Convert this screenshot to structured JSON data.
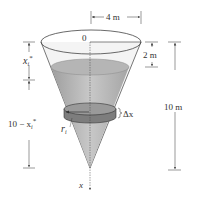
{
  "figure": {
    "labels": {
      "origin": "0",
      "top_width": "4 m",
      "water_offset": "2 m",
      "height": "10 m",
      "depth_upper": "x",
      "depth_upper_sub": "i",
      "depth_upper_sup": "*",
      "depth_lower_prefix": "10 − x",
      "depth_lower_sub": "i",
      "depth_lower_sup": "*",
      "radius": "r",
      "radius_sub": "i",
      "slab_thickness": "Δx",
      "axis": "x"
    },
    "colors": {
      "line": "#333333",
      "water": "#bdbdbd",
      "water_surface": "#a8a8a8",
      "slab": "#8c8c8c",
      "cone_glass": "#f2f2f2"
    }
  }
}
